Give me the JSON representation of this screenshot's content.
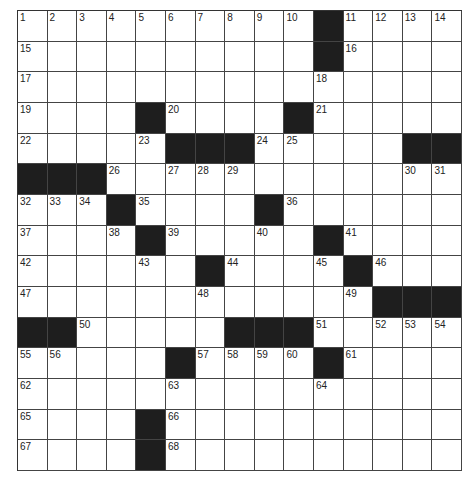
{
  "puzzle": {
    "rows": 15,
    "cols": 15,
    "colors": {
      "block": "#1e1e1e",
      "cell": "#ffffff",
      "line": "#444444"
    },
    "grid": [
      [
        "1",
        "2",
        "3",
        "4",
        "5",
        "6",
        "7",
        "8",
        "9",
        "10",
        "#",
        "11",
        "12",
        "13",
        "14"
      ],
      [
        "15",
        "",
        "",
        "",
        "",
        "",
        "",
        "",
        "",
        "",
        "#",
        "16",
        "",
        "",
        ""
      ],
      [
        "17",
        "",
        "",
        "",
        "",
        "",
        "",
        "",
        "",
        "",
        "18",
        "",
        "",
        "",
        ""
      ],
      [
        "19",
        "",
        "",
        "",
        "#",
        "20",
        "",
        "",
        "",
        "#",
        "21",
        "",
        "",
        "",
        ""
      ],
      [
        "22",
        "",
        "",
        "",
        "23",
        "#",
        "#",
        "#",
        "24",
        "25",
        "",
        "",
        "",
        "#",
        "#"
      ],
      [
        "#",
        "#",
        "#",
        "26",
        "",
        "27",
        "28",
        "29",
        "",
        "",
        "",
        "",
        "",
        "30",
        "31"
      ],
      [
        "32",
        "33",
        "34",
        "#",
        "35",
        "",
        "",
        "",
        "#",
        "36",
        "",
        "",
        "",
        "",
        ""
      ],
      [
        "37",
        "",
        "",
        "38",
        "#",
        "39",
        "",
        "",
        "40",
        "",
        "#",
        "41",
        "",
        "",
        ""
      ],
      [
        "42",
        "",
        "",
        "",
        "43",
        "",
        "#",
        "44",
        "",
        "",
        "45",
        "#",
        "46",
        "",
        ""
      ],
      [
        "47",
        "",
        "",
        "",
        "",
        "",
        "48",
        "",
        "",
        "",
        "",
        "49",
        "#",
        "#",
        "#"
      ],
      [
        "#",
        "#",
        "50",
        "",
        "",
        "",
        "",
        "#",
        "#",
        "#",
        "51",
        "",
        "52",
        "53",
        "54"
      ],
      [
        "55",
        "56",
        "",
        "",
        "",
        "#",
        "57",
        "58",
        "59",
        "60",
        "#",
        "61",
        "",
        "",
        ""
      ],
      [
        "62",
        "",
        "",
        "",
        "",
        "63",
        "",
        "",
        "",
        "",
        "64",
        "",
        "",
        "",
        ""
      ],
      [
        "65",
        "",
        "",
        "",
        "#",
        "66",
        "",
        "",
        "",
        "",
        "",
        "",
        "",
        "",
        ""
      ],
      [
        "67",
        "",
        "",
        "",
        "#",
        "68",
        "",
        "",
        "",
        "",
        "",
        "",
        "",
        "",
        ""
      ]
    ]
  }
}
